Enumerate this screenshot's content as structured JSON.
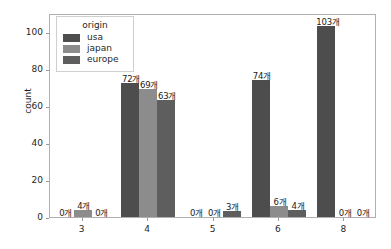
{
  "chart_data": {
    "type": "bar",
    "title": "",
    "xlabel": "",
    "ylabel": "count",
    "categories": [
      "3",
      "4",
      "5",
      "6",
      "8"
    ],
    "ylim": [
      0,
      110
    ],
    "yticks": [
      0,
      20,
      40,
      60,
      80,
      100
    ],
    "grid": false,
    "legend": {
      "title": "origin",
      "position": "upper left",
      "entries": [
        "usa",
        "japan",
        "europe"
      ]
    },
    "series": [
      {
        "name": "usa",
        "color": "#4d4d4d",
        "values": [
          0,
          72,
          0,
          74,
          103
        ],
        "labels": [
          "0개",
          "72개",
          "0개",
          "74개",
          "103개"
        ]
      },
      {
        "name": "japan",
        "color": "#8c8c8c",
        "values": [
          4,
          69,
          0,
          6,
          0
        ],
        "labels": [
          "4개",
          "69개",
          "0개",
          "6개",
          "0개"
        ]
      },
      {
        "name": "europe",
        "color": "#5e5e5e",
        "values": [
          0,
          63,
          3,
          4,
          0
        ],
        "labels": [
          "0개",
          "63개",
          "3개",
          "4개",
          "0개"
        ]
      }
    ],
    "annotation_suffix": "개"
  }
}
